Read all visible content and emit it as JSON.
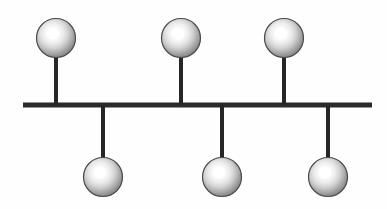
{
  "figure": {
    "type": "node-link-diagram",
    "width": 387,
    "height": 209,
    "background_color": "#fefefe"
  },
  "colors": {
    "stroke": "#262626",
    "spine": "#2b2b2b",
    "node_outline": "#4a4a4a",
    "node_highlight": "#ffffff",
    "node_midtone": "#d8d8d8",
    "node_shadow": "#8a8a8a",
    "background": "#fefefe"
  },
  "spine": {
    "label": "horizontal-spine",
    "x1": 23,
    "x2": 372,
    "y": 105,
    "thickness": 5
  },
  "geometry": {
    "node_radius": 19.5,
    "stem_width": 4,
    "top_node_center_y": 38,
    "bottom_node_center_y": 177
  },
  "nodes": [
    {
      "id": "node-top-1",
      "label": "Top node 1",
      "side": "top",
      "cx": 56,
      "cy": 38,
      "r": 19.5,
      "stem_x": 56,
      "stem_y1": 57,
      "stem_y2": 105
    },
    {
      "id": "node-top-2",
      "label": "Top node 2",
      "side": "top",
      "cx": 181,
      "cy": 38,
      "r": 19.5,
      "stem_x": 181,
      "stem_y1": 57,
      "stem_y2": 105
    },
    {
      "id": "node-top-3",
      "label": "Top node 3",
      "side": "top",
      "cx": 284,
      "cy": 38,
      "r": 19.5,
      "stem_x": 284,
      "stem_y1": 57,
      "stem_y2": 105
    },
    {
      "id": "node-bottom-1",
      "label": "Bottom node 1",
      "side": "bottom",
      "cx": 103,
      "cy": 177,
      "r": 19.5,
      "stem_x": 103,
      "stem_y1": 105,
      "stem_y2": 160
    },
    {
      "id": "node-bottom-2",
      "label": "Bottom node 2",
      "side": "bottom",
      "cx": 222,
      "cy": 177,
      "r": 19.5,
      "stem_x": 222,
      "stem_y1": 105,
      "stem_y2": 160
    },
    {
      "id": "node-bottom-3",
      "label": "Bottom node 3",
      "side": "bottom",
      "cx": 328,
      "cy": 177,
      "r": 19.5,
      "stem_x": 328,
      "stem_y1": 105,
      "stem_y2": 160
    }
  ],
  "counts": {
    "total_nodes": 6,
    "top_nodes": 3,
    "bottom_nodes": 3,
    "stems": 6
  }
}
